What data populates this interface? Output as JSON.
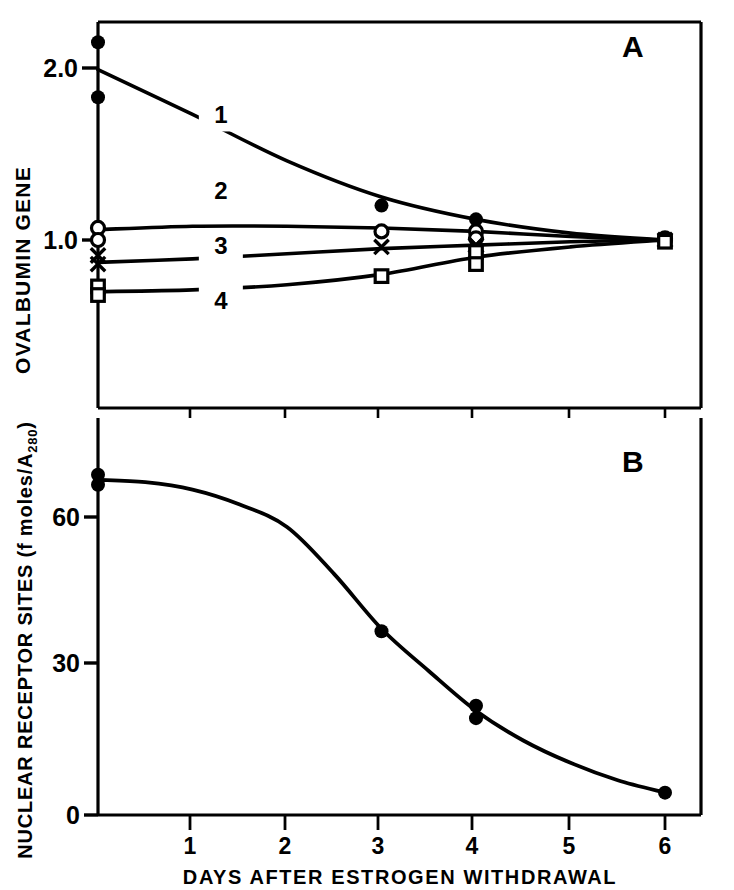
{
  "figure": {
    "background": "#ffffff",
    "ink": "#000000",
    "xaxis_title": "DAYS AFTER ESTROGEN WITHDRAWAL"
  },
  "panelA": {
    "label": "A",
    "ylabel": "OVALBUMIN GENE",
    "yticks": [
      "2.0",
      "1.0"
    ],
    "curve_labels": [
      "1",
      "2",
      "3",
      "4"
    ]
  },
  "panelB": {
    "label": "B",
    "ylabel_main": "NUCLEAR RECEPTOR SITES (f moles/A",
    "ylabel_sub": "280",
    "ylabel_tail": ")",
    "yticks": [
      "60",
      "30",
      "0"
    ]
  },
  "xaxis": {
    "ticks": [
      "1",
      "2",
      "3",
      "4",
      "5",
      "6"
    ]
  },
  "chart_data": [
    {
      "type": "line",
      "panel": "A",
      "title": "A",
      "xlabel": "DAYS AFTER ESTROGEN WITHDRAWAL",
      "ylabel": "OVALBUMIN GENE",
      "xlim": [
        0,
        6.45
      ],
      "ylim": [
        0.38,
        2.27
      ],
      "xticks": [
        1,
        2,
        3,
        4,
        5,
        6
      ],
      "yticks": [
        1.0,
        2.0
      ],
      "grid": false,
      "legend": "inline curve numbers 1-4",
      "series": [
        {
          "name": "1",
          "marker": "filled-circle",
          "label_x": 1.3,
          "label_y": 1.73,
          "curve_x": [
            0,
            1,
            2,
            3,
            4,
            5,
            6
          ],
          "curve_y": [
            1.99,
            1.73,
            1.46,
            1.25,
            1.12,
            1.04,
            1.0
          ],
          "points_x": [
            0,
            0,
            3,
            4
          ],
          "points_y": [
            2.15,
            1.83,
            1.2,
            1.12
          ]
        },
        {
          "name": "2",
          "marker": "open-circle",
          "label_x": 1.3,
          "label_y": 1.29,
          "curve_x": [
            0,
            1,
            2,
            3,
            4,
            5,
            6
          ],
          "curve_y": [
            1.06,
            1.08,
            1.08,
            1.07,
            1.05,
            1.02,
            1.0
          ],
          "points_x": [
            0,
            0,
            3,
            4,
            4,
            6,
            6
          ],
          "points_y": [
            1.07,
            1.0,
            1.05,
            1.05,
            1.01,
            1.01,
            1.0
          ]
        },
        {
          "name": "3",
          "marker": "cross",
          "label_x": 1.3,
          "label_y": 0.97,
          "curve_x": [
            0,
            1,
            2,
            3,
            4,
            5,
            6
          ],
          "curve_y": [
            0.87,
            0.89,
            0.92,
            0.95,
            0.97,
            0.99,
            1.0
          ],
          "points_x": [
            0,
            0,
            3,
            4,
            4,
            6
          ],
          "points_y": [
            0.91,
            0.86,
            0.96,
            0.97,
            0.97,
            1.0
          ]
        },
        {
          "name": "4",
          "marker": "open-square",
          "label_x": 1.3,
          "label_y": 0.65,
          "curve_x": [
            0,
            1,
            2,
            3,
            4,
            5,
            6
          ],
          "curve_y": [
            0.7,
            0.71,
            0.74,
            0.8,
            0.9,
            0.96,
            1.0
          ],
          "points_x": [
            0,
            0,
            3,
            4,
            4,
            6
          ],
          "points_y": [
            0.73,
            0.68,
            0.79,
            0.93,
            0.86,
            0.99
          ]
        }
      ]
    },
    {
      "type": "line",
      "panel": "B",
      "title": "B",
      "xlabel": "DAYS AFTER ESTROGEN WITHDRAWAL",
      "ylabel": "NUCLEAR RECEPTOR SITES (f moles/A280)",
      "xlim": [
        0,
        6.45
      ],
      "ylim": [
        0,
        78
      ],
      "xticks": [
        1,
        2,
        3,
        4,
        5,
        6
      ],
      "yticks": [
        0,
        30,
        60
      ],
      "grid": false,
      "marker": "filled-circle",
      "curve_x": [
        0,
        0.5,
        1,
        1.5,
        2,
        2.5,
        3,
        3.5,
        4,
        4.5,
        5,
        5.5,
        6
      ],
      "curve_y": [
        67.5,
        67.0,
        65.5,
        62.5,
        58.0,
        48.5,
        37.5,
        29.0,
        21.0,
        15.0,
        10.5,
        7.0,
        4.5
      ],
      "points_x": [
        0,
        0,
        3,
        4,
        4,
        6
      ],
      "points_y": [
        68.5,
        66.5,
        37.0,
        22.0,
        19.5,
        4.5
      ]
    }
  ]
}
